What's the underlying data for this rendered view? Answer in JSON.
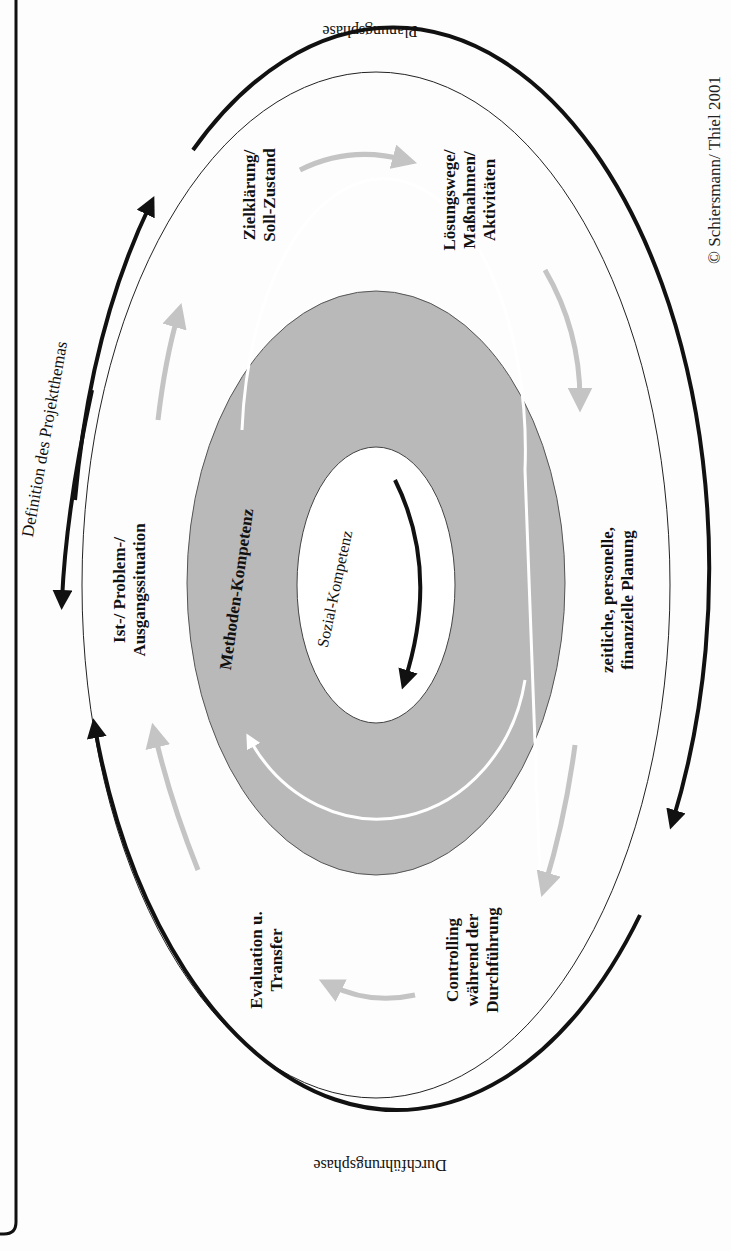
{
  "diagram": {
    "copyright": "© Schiersmann/ Thiel 2001",
    "phases": {
      "planning": "Planungsphase",
      "execution": "Durchführungsphase",
      "definition": "Definition des Projektthemas"
    },
    "steps": [
      {
        "id": "ist",
        "lines": [
          "Ist-/ Problem-/",
          "Ausgangssituation"
        ]
      },
      {
        "id": "ziel",
        "lines": [
          "Zielklärung/",
          "Soll-Zustand"
        ]
      },
      {
        "id": "loesung",
        "lines": [
          "Lösungswege/",
          "Maßnahmen/",
          "Aktivitäten"
        ]
      },
      {
        "id": "planung",
        "lines": [
          "zeitliche, personelle,",
          "finanzielle  Planung"
        ]
      },
      {
        "id": "controlling",
        "lines": [
          "Controlling",
          "während der",
          "Durchführung"
        ]
      },
      {
        "id": "evaluation",
        "lines": [
          "Evaluation u.",
          "Transfer"
        ]
      }
    ],
    "rings": {
      "middle": "Methoden-Kompetenz",
      "inner": "Sozial-Kompetenz"
    },
    "colors": {
      "ring_gray": "#b9b9b9",
      "arrow_gray": "#c4c4c4",
      "ink": "#111111",
      "paper": "#fdfdfd"
    }
  }
}
